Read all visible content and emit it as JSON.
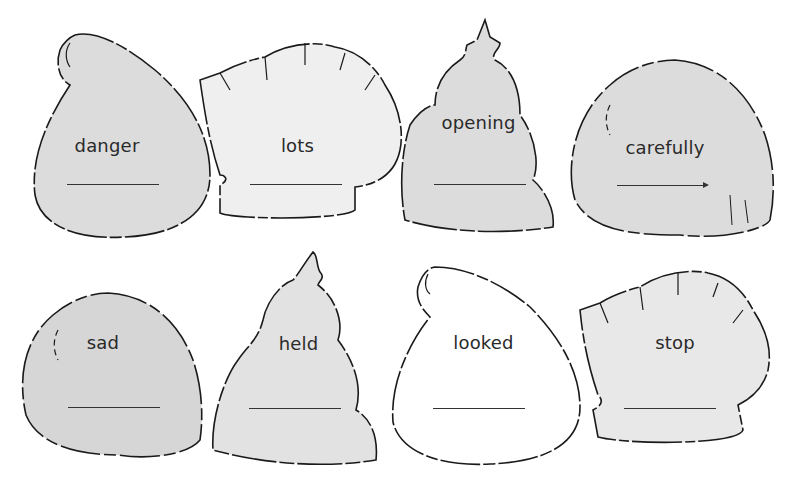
{
  "worksheet": {
    "colors": {
      "fill_gray": "#dcdcdc",
      "fill_light": "#efefef",
      "fill_white": "#ffffff",
      "outline": "#1a1a1a"
    },
    "cards": [
      {
        "word": "danger",
        "shape": "santa-hat",
        "fill": "gray"
      },
      {
        "word": "lots",
        "shape": "mitten",
        "fill": "light"
      },
      {
        "word": "opening",
        "shape": "beanie",
        "fill": "gray"
      },
      {
        "word": "carefully",
        "shape": "round-hat",
        "fill": "gray"
      },
      {
        "word": "sad",
        "shape": "round-hat",
        "fill": "gray"
      },
      {
        "word": "held",
        "shape": "beanie",
        "fill": "light"
      },
      {
        "word": "looked",
        "shape": "santa-hat",
        "fill": "white"
      },
      {
        "word": "stop",
        "shape": "mitten",
        "fill": "light"
      }
    ]
  }
}
